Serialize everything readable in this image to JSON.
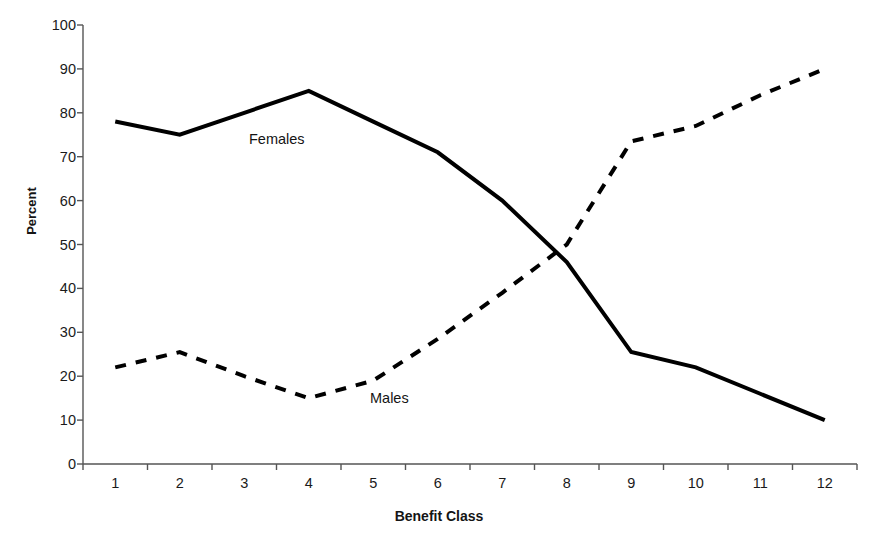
{
  "chart_data": {
    "type": "line",
    "title": "",
    "xlabel": "Benefit Class",
    "ylabel": "Percent",
    "categories": [
      "1",
      "2",
      "3",
      "4",
      "5",
      "6",
      "7",
      "8",
      "9",
      "10",
      "11",
      "12"
    ],
    "xlim": [
      0.5,
      12.5
    ],
    "ylim": [
      0,
      100
    ],
    "yticks": [
      0,
      10,
      20,
      30,
      40,
      50,
      60,
      70,
      80,
      90,
      100
    ],
    "ytick_labels": [
      "0",
      "10",
      "20",
      "30",
      "40",
      "50",
      "60",
      "70",
      "80",
      "90",
      "100"
    ],
    "grid": false,
    "legend_position": "inline-annotations",
    "series": [
      {
        "name": "Females",
        "style": "solid",
        "color": "#000000",
        "line_width": 4,
        "values": [
          78,
          75,
          80,
          85,
          78,
          71,
          60,
          46,
          25.5,
          22,
          16,
          10
        ]
      },
      {
        "name": "Males",
        "style": "dashed",
        "color": "#000000",
        "line_width": 4,
        "values": [
          22,
          25.5,
          20,
          15,
          19,
          28.5,
          39,
          50,
          73.5,
          77,
          84,
          90
        ]
      }
    ],
    "annotations": [
      {
        "text": "Females",
        "x": 4.6,
        "y": 68
      },
      {
        "text": "Males",
        "x": 5.5,
        "y": 17
      }
    ]
  },
  "axes": {
    "y_title": "Percent",
    "x_title": "Benefit Class",
    "axis_color": "#555555"
  }
}
